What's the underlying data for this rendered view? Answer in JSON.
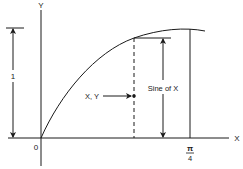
{
  "diagram": {
    "title": "",
    "axes": {
      "x_label": "X",
      "y_label": "Y",
      "origin_label": "0",
      "x_tick_numerator": "π",
      "x_tick_denominator": "4"
    },
    "dimension": {
      "height_label": "1"
    },
    "annotations": {
      "point_label": "X, Y",
      "sine_label": "Sine of X"
    },
    "colors": {
      "stroke": "#1a1a1a",
      "background": "#ffffff"
    }
  }
}
